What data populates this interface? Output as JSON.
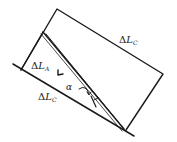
{
  "diagram": {
    "type": "geometry",
    "stroke_color": "#1a1a1a",
    "background": "#ffffff",
    "labels": {
      "top_right": {
        "delta": "Δ",
        "var": "L",
        "sub": "C"
      },
      "inner_left": {
        "delta": "Δ",
        "var": "L",
        "sub": "A"
      },
      "bottom": {
        "delta": "Δ",
        "var": "L",
        "sub": "C"
      },
      "angle": "α"
    },
    "shapes": {
      "rectangle": [
        [
          57,
          9
        ],
        [
          163,
          74
        ],
        [
          126,
          130
        ],
        [
          21,
          70
        ]
      ],
      "base_line": [
        [
          13,
          64
        ],
        [
          133,
          136
        ]
      ],
      "inner_apex": [
        43,
        32
      ],
      "bottom_vertex": [
        124,
        129
      ]
    }
  }
}
